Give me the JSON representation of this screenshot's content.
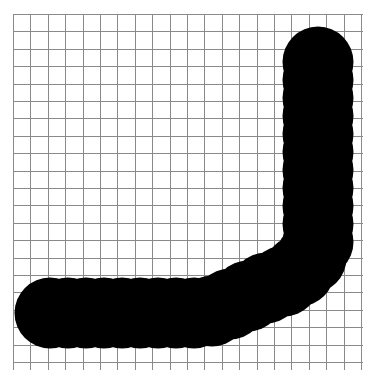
{
  "canvas": {
    "width": 378,
    "height": 389,
    "background_color": "#ffffff",
    "label": "graph-paper-sketch-canvas"
  },
  "grid": {
    "name": "graph-paper-grid",
    "line_color": "#8a8a8a",
    "line_width": 1,
    "cell_size": 17.4,
    "origin_x": 13,
    "origin_y": 14,
    "end_x": 363,
    "end_y": 370,
    "columns": 21,
    "rows": 21,
    "visible": true
  },
  "stroke": {
    "name": "l-shaped-brush-stroke",
    "color": "#000000",
    "brush": "round",
    "brush_diameter": 71,
    "brush_radius": 35.5,
    "dot_spacing": 8,
    "edge_style": "scalloped",
    "path_points": [
      {
        "x": 318,
        "y": 62
      },
      {
        "x": 318,
        "y": 80
      },
      {
        "x": 318,
        "y": 98
      },
      {
        "x": 318,
        "y": 116
      },
      {
        "x": 318,
        "y": 134
      },
      {
        "x": 318,
        "y": 152
      },
      {
        "x": 318,
        "y": 170
      },
      {
        "x": 318,
        "y": 188
      },
      {
        "x": 318,
        "y": 206
      },
      {
        "x": 318,
        "y": 224
      },
      {
        "x": 318,
        "y": 242
      },
      {
        "x": 311,
        "y": 258
      },
      {
        "x": 299,
        "y": 271
      },
      {
        "x": 284,
        "y": 281
      },
      {
        "x": 266,
        "y": 288
      },
      {
        "x": 248,
        "y": 296
      },
      {
        "x": 230,
        "y": 304
      },
      {
        "x": 212,
        "y": 311
      },
      {
        "x": 194,
        "y": 313
      },
      {
        "x": 176,
        "y": 313
      },
      {
        "x": 158,
        "y": 313
      },
      {
        "x": 140,
        "y": 313
      },
      {
        "x": 122,
        "y": 313
      },
      {
        "x": 104,
        "y": 313
      },
      {
        "x": 86,
        "y": 313
      },
      {
        "x": 68,
        "y": 313
      },
      {
        "x": 50,
        "y": 313
      }
    ],
    "bounding_box": {
      "left": 13,
      "top": 27,
      "right": 354,
      "bottom": 341
    },
    "vertical_segment": {
      "x_min": 282,
      "x_max": 354,
      "y_min": 27,
      "y_max": 290,
      "width": 72,
      "height": 263
    },
    "horizontal_segment": {
      "x_min": 13,
      "x_max": 310,
      "y_min": 287,
      "y_max": 341,
      "width": 297,
      "height": 54
    }
  }
}
